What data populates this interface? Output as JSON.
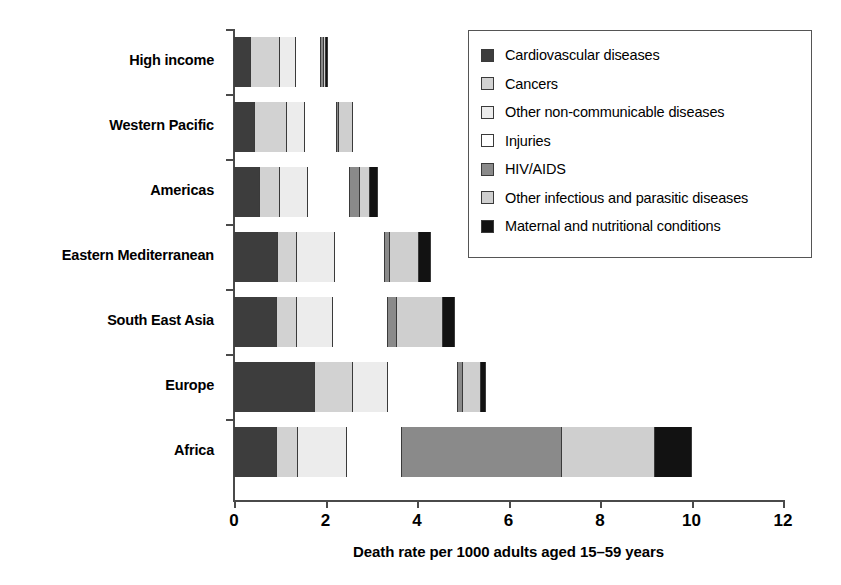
{
  "chart_data": {
    "type": "bar",
    "orientation": "horizontal",
    "stacked": true,
    "title": "",
    "xlabel": "Death rate per 1000 adults aged 15–59 years",
    "ylabel": "",
    "xlim": [
      0,
      12
    ],
    "xticks": [
      0,
      2,
      4,
      6,
      8,
      10,
      12
    ],
    "xtick_labels": [
      "0",
      "2",
      "4",
      "6",
      "8",
      "10",
      "12"
    ],
    "grid": false,
    "legend_position": "upper right",
    "categories": [
      "High income",
      "Western Pacific",
      "Americas",
      "Eastern Mediterranean",
      "South East Asia",
      "Europe",
      "Africa"
    ],
    "series": [
      {
        "name": "Cardiovascular diseases",
        "color": "#3d3d3d",
        "values": [
          0.37,
          0.46,
          0.57,
          0.97,
          0.94,
          1.77,
          0.95
        ]
      },
      {
        "name": "Cancers",
        "color": "#d2d2d2",
        "values": [
          0.63,
          0.7,
          0.43,
          0.41,
          0.44,
          0.83,
          0.44
        ]
      },
      {
        "name": "Other non-communicable diseases",
        "color": "#ececec",
        "values": [
          0.36,
          0.39,
          0.62,
          0.82,
          0.79,
          0.77,
          1.09
        ]
      },
      {
        "name": "Injuries",
        "color": "#ffffff",
        "values": [
          0.54,
          0.7,
          0.92,
          1.1,
          1.2,
          1.53,
          1.2
        ]
      },
      {
        "name": "HIV/AIDS",
        "color": "#8a8a8a",
        "values": [
          0.06,
          0.04,
          0.22,
          0.11,
          0.2,
          0.1,
          3.5
        ]
      },
      {
        "name": "Other infectious and parasitic diseases",
        "color": "#cfcfcf",
        "values": [
          0.06,
          0.31,
          0.22,
          0.63,
          1.0,
          0.4,
          2.03
        ]
      },
      {
        "name": "Maternal and nutritional conditions",
        "color": "#121212",
        "values": [
          0.04,
          0.0,
          0.17,
          0.26,
          0.27,
          0.1,
          0.81
        ]
      }
    ],
    "totals": [
      2.06,
      2.6,
      3.15,
      4.3,
      4.84,
      5.5,
      10.02
    ]
  },
  "legend": {
    "items": [
      {
        "label": "Cardiovascular diseases",
        "swatch": "#3d3d3d"
      },
      {
        "label": "Cancers",
        "swatch": "#d2d2d2"
      },
      {
        "label": "Other non-communicable diseases",
        "swatch": "#ececec"
      },
      {
        "label": "Injuries",
        "swatch": "#ffffff"
      },
      {
        "label": "HIV/AIDS",
        "swatch": "#8a8a8a"
      },
      {
        "label": "Other infectious and parasitic diseases",
        "swatch": "#cfcfcf"
      },
      {
        "label": "Maternal and nutritional conditions",
        "swatch": "#121212"
      }
    ]
  }
}
